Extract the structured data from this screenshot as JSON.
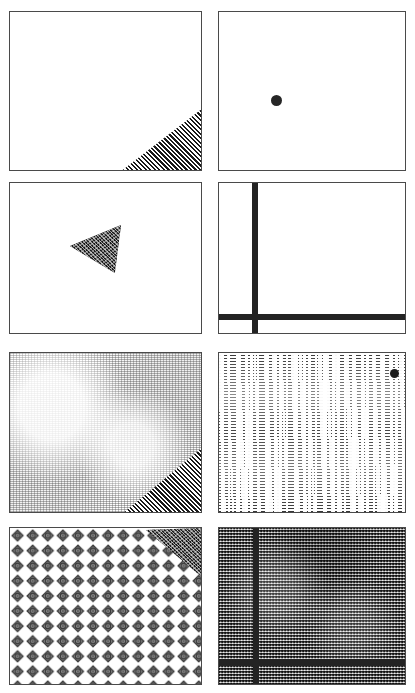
{
  "figure": {
    "kind": "texture-and-shape-panel-grid",
    "layout": {
      "columns": 2,
      "rows": 4,
      "panel_count": 8
    },
    "background_color": "#ffffff",
    "border_color": "#4a4a4a",
    "ink_color": "#232323"
  },
  "panels": [
    {
      "id": "panel-1",
      "name": "blank-field-with-hatched-corner-wedge",
      "row": 1,
      "column": 1,
      "x": 9,
      "y": 11,
      "width": 193,
      "height": 160,
      "background": "blank",
      "elements": [
        {
          "type": "wedge",
          "name": "hatched-corner-wedge",
          "corner": "bottom-right",
          "fill": "diagonal-hatch-45",
          "x": 119,
          "y": 98,
          "width": 74,
          "height": 62
        }
      ]
    },
    {
      "id": "panel-2",
      "name": "blank-field-with-single-dot",
      "row": 1,
      "column": 2,
      "x": 218,
      "y": 11,
      "width": 188,
      "height": 160,
      "background": "blank",
      "elements": [
        {
          "type": "dot",
          "name": "solid-dot-marker",
          "center_x": 276,
          "center_y": 100,
          "diameter": 11,
          "color": "#262626"
        }
      ]
    },
    {
      "id": "panel-3",
      "name": "blank-field-with-left-pointing-triangle",
      "row": 2,
      "column": 1,
      "x": 9,
      "y": 182,
      "width": 193,
      "height": 152,
      "background": "blank",
      "elements": [
        {
          "type": "triangle",
          "name": "speckled-left-pointing-triangle",
          "fill": "speckled-dark",
          "points": "70,247 119,226 113,271"
        }
      ]
    },
    {
      "id": "panel-4",
      "name": "blank-field-with-cross-bars",
      "row": 2,
      "column": 2,
      "x": 218,
      "y": 182,
      "width": 188,
      "height": 152,
      "background": "blank",
      "elements": [
        {
          "type": "bar",
          "name": "vertical-bar",
          "orientation": "vertical",
          "position": 253,
          "thickness": 6
        },
        {
          "type": "bar",
          "name": "horizontal-bar",
          "orientation": "horizontal",
          "position": 315,
          "thickness": 6
        }
      ]
    },
    {
      "id": "panel-5",
      "name": "fine-weave-texture-with-hatched-corner-wedge",
      "row": 3,
      "column": 1,
      "x": 9,
      "y": 352,
      "width": 193,
      "height": 161,
      "background": "fine-weave",
      "elements": [
        {
          "type": "wedge",
          "name": "hatched-corner-wedge",
          "corner": "bottom-right",
          "fill": "diagonal-hatch-45",
          "x": 128,
          "y": 452,
          "width": 65,
          "height": 60
        }
      ]
    },
    {
      "id": "panel-6",
      "name": "horizontal-streak-texture-with-dot",
      "row": 3,
      "column": 2,
      "x": 218,
      "y": 352,
      "width": 188,
      "height": 161,
      "background": "horizontal-streaks",
      "elements": [
        {
          "type": "dot",
          "name": "solid-dot-marker",
          "center_x": 393,
          "center_y": 372,
          "diameter": 9,
          "color": "#1d1d1d"
        }
      ]
    },
    {
      "id": "panel-7",
      "name": "diamond-lattice-texture-with-triangle-wedge",
      "row": 4,
      "column": 1,
      "x": 9,
      "y": 527,
      "width": 193,
      "height": 158,
      "background": "diamond-lattice",
      "lattice": {
        "spacing_x": 15,
        "spacing_y": 15,
        "glyph": "diamond-crosshair"
      },
      "elements": [
        {
          "type": "wedge",
          "name": "speckled-corner-wedge",
          "corner": "top-right",
          "fill": "speckled-dark",
          "x": 145,
          "y": 527,
          "width": 57,
          "height": 48
        }
      ]
    },
    {
      "id": "panel-8",
      "name": "dense-grid-texture-with-cross-bars",
      "row": 4,
      "column": 2,
      "x": 218,
      "y": 527,
      "width": 188,
      "height": 158,
      "background": "dense-grid",
      "elements": [
        {
          "type": "bar",
          "name": "vertical-bar",
          "orientation": "vertical",
          "position": 252,
          "thickness": 6
        },
        {
          "type": "bar",
          "name": "horizontal-bar",
          "orientation": "horizontal",
          "position": 665,
          "thickness": 7
        }
      ]
    }
  ]
}
